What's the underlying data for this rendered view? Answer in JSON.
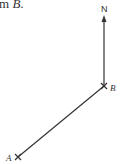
{
  "caption": {
    "prefix": "m ",
    "point": "B",
    "suffix": "."
  },
  "diagram": {
    "north_label": "N",
    "points": [
      {
        "id": "A",
        "label": "A",
        "x": 18,
        "y": 157
      },
      {
        "id": "B",
        "label": "B",
        "x": 104,
        "y": 86
      }
    ],
    "north_arrow": {
      "from": "B",
      "to_y": 17
    },
    "colors": {
      "line": "#333333",
      "text": "#333333"
    }
  }
}
